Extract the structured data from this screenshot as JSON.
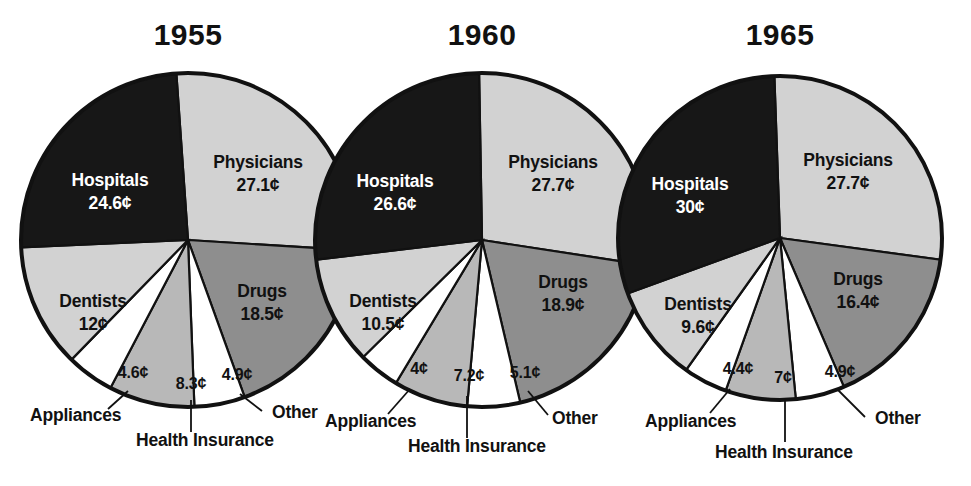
{
  "figure": {
    "palette": {
      "dark": "#171717",
      "light_gray": "#d2d2d2",
      "mid_gray": "#8e8e8e",
      "pale_gray": "#b8b8b8",
      "white": "#ffffff",
      "outline": "#111111",
      "background": "#ffffff"
    }
  },
  "chart_data": {
    "type": "pie",
    "title": "",
    "subtitle": "",
    "xlabel": "",
    "ylabel": "",
    "legend_position": "none",
    "grid": false,
    "unit": "¢",
    "note": "Three pie charts showing distribution of the health care dollar in cents for 1955, 1960 and 1965.",
    "categories": [
      "Physicians",
      "Drugs",
      "Other",
      "Health Insurance",
      "Appliances",
      "Dentists",
      "Hospitals"
    ],
    "charts": [
      {
        "title": "1955",
        "cx": 188,
        "cy": 240,
        "r": 167,
        "start_angle_deg": -4,
        "slices": [
          {
            "label": "Physicians",
            "value": 27.1,
            "display": "27.1¢",
            "fill": "light_gray",
            "label_inside": true,
            "tx": 258,
            "ty": 168,
            "text_color": "dark"
          },
          {
            "label": "Drugs",
            "value": 18.5,
            "display": "18.5¢",
            "fill": "mid_gray",
            "label_inside": true,
            "tx": 262,
            "ty": 297,
            "text_color": "dark"
          },
          {
            "label": "Other",
            "value": 4.9,
            "display": "4.9¢",
            "fill": "white",
            "label_inside": false,
            "tx": 237,
            "ty": 380,
            "text_color": "dark",
            "out_label": "Other",
            "ox": 272,
            "oy": 418,
            "leader": [
              [
                240,
                394
              ],
              [
                262,
                411
              ]
            ]
          },
          {
            "label": "Health Insurance",
            "value": 8.3,
            "display": "8.3¢",
            "fill": "pale_gray",
            "label_inside": false,
            "tx": 191,
            "ty": 389,
            "text_color": "dark",
            "out_label": "Health Insurance",
            "ox": 136,
            "oy": 446,
            "leader": [
              [
                191,
                400
              ],
              [
                191,
                432
              ]
            ]
          },
          {
            "label": "Appliances",
            "value": 4.6,
            "display": "4.6¢",
            "fill": "white",
            "label_inside": false,
            "tx": 133,
            "ty": 378,
            "text_color": "dark",
            "out_label": "Appliances",
            "ox": 30,
            "oy": 421,
            "leader": [
              [
                128,
                391
              ],
              [
                108,
                409
              ]
            ]
          },
          {
            "label": "Dentists",
            "value": 12.0,
            "display": "12¢",
            "fill": "light_gray",
            "label_inside": true,
            "tx": 93,
            "ty": 307,
            "text_color": "dark"
          },
          {
            "label": "Hospitals",
            "value": 24.6,
            "display": "24.6¢",
            "fill": "dark",
            "label_inside": true,
            "tx": 110,
            "ty": 186,
            "text_color": "white"
          }
        ]
      },
      {
        "title": "1960",
        "cx": 482,
        "cy": 240,
        "r": 167,
        "start_angle_deg": -1,
        "slices": [
          {
            "label": "Physicians",
            "value": 27.7,
            "display": "27.7¢",
            "fill": "light_gray",
            "label_inside": true,
            "tx": 553,
            "ty": 168,
            "text_color": "dark"
          },
          {
            "label": "Drugs",
            "value": 18.9,
            "display": "18.9¢",
            "fill": "mid_gray",
            "label_inside": true,
            "tx": 563,
            "ty": 288,
            "text_color": "dark"
          },
          {
            "label": "Other",
            "value": 5.1,
            "display": "5.1¢",
            "fill": "white",
            "label_inside": false,
            "tx": 525,
            "ty": 378,
            "text_color": "dark",
            "out_label": "Other",
            "ox": 552,
            "oy": 424,
            "leader": [
              [
                528,
                391
              ],
              [
                548,
                415
              ]
            ]
          },
          {
            "label": "Health Insurance",
            "value": 7.2,
            "display": "7.2¢",
            "fill": "pale_gray",
            "label_inside": false,
            "tx": 469,
            "ty": 381,
            "text_color": "dark",
            "out_label": "Health Insurance",
            "ox": 408,
            "oy": 452,
            "leader": [
              [
                467,
                396
              ],
              [
                467,
                438
              ]
            ]
          },
          {
            "label": "Appliances",
            "value": 4.0,
            "display": "4¢",
            "fill": "white",
            "label_inside": false,
            "tx": 419,
            "ty": 374,
            "text_color": "dark",
            "out_label": "Appliances",
            "ox": 325,
            "oy": 427,
            "leader": [
              [
                410,
                389
              ],
              [
                388,
                414
              ]
            ]
          },
          {
            "label": "Dentists",
            "value": 10.5,
            "display": "10.5¢",
            "fill": "light_gray",
            "label_inside": true,
            "tx": 383,
            "ty": 307,
            "text_color": "dark"
          },
          {
            "label": "Hospitals",
            "value": 26.6,
            "display": "26.6¢",
            "fill": "dark",
            "label_inside": true,
            "tx": 395,
            "ty": 187,
            "text_color": "white"
          }
        ]
      },
      {
        "title": "1965",
        "cx": 780,
        "cy": 238,
        "r": 162,
        "start_angle_deg": -2,
        "slices": [
          {
            "label": "Physicians",
            "value": 27.7,
            "display": "27.7¢",
            "fill": "light_gray",
            "label_inside": true,
            "tx": 848,
            "ty": 166,
            "text_color": "dark"
          },
          {
            "label": "Drugs",
            "value": 16.4,
            "display": "16.4¢",
            "fill": "mid_gray",
            "label_inside": true,
            "tx": 858,
            "ty": 285,
            "text_color": "dark"
          },
          {
            "label": "Other",
            "value": 4.9,
            "display": "4.9¢",
            "fill": "white",
            "label_inside": false,
            "tx": 840,
            "ty": 377,
            "text_color": "dark",
            "out_label": "Other",
            "ox": 875,
            "oy": 424,
            "leader": [
              [
                838,
                390
              ],
              [
                865,
                417
              ]
            ]
          },
          {
            "label": "Health Insurance",
            "value": 7.0,
            "display": "7¢",
            "fill": "pale_gray",
            "label_inside": false,
            "tx": 783,
            "ty": 383,
            "text_color": "dark",
            "out_label": "Health Insurance",
            "ox": 715,
            "oy": 458,
            "leader": [
              [
                785,
                398
              ],
              [
                785,
                442
              ]
            ]
          },
          {
            "label": "Appliances",
            "value": 4.4,
            "display": "4.4¢",
            "fill": "white",
            "label_inside": false,
            "tx": 738,
            "ty": 374,
            "text_color": "dark",
            "out_label": "Appliances",
            "ox": 645,
            "oy": 427,
            "leader": [
              [
                730,
                389
              ],
              [
                710,
                413
              ]
            ]
          },
          {
            "label": "Dentists",
            "value": 9.6,
            "display": "9.6¢",
            "fill": "light_gray",
            "label_inside": true,
            "tx": 698,
            "ty": 310,
            "text_color": "dark"
          },
          {
            "label": "Hospitals",
            "value": 30.0,
            "display": "30¢",
            "fill": "dark",
            "label_inside": true,
            "tx": 690,
            "ty": 190,
            "text_color": "white"
          }
        ]
      }
    ]
  }
}
